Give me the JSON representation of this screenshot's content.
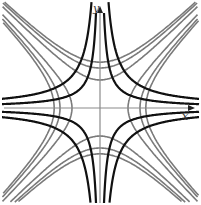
{
  "diagram": {
    "axes": {
      "x_label": "x",
      "y_label": "y",
      "origin_px": [
        100,
        108
      ],
      "color": "#8a8a8a"
    },
    "families": [
      {
        "name": "rectangular hyperbolas xy = c",
        "color": "#111111",
        "width": 2.2,
        "constants": [
          900,
          -900,
          380,
          -380
        ]
      },
      {
        "name": "hyperbolas x^2 - y^2 = k",
        "color": "#7a7a7a",
        "width": 1.6,
        "constants": [
          784,
          -784,
          1600,
          -1600,
          2100,
          -2100
        ]
      }
    ]
  }
}
